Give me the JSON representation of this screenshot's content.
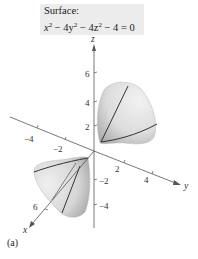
{
  "figure": {
    "label_title": "Surface:",
    "equation": {
      "t1": "x",
      "e1": "2",
      "t2": " − 4y",
      "e2": "2",
      "t3": " − 4z",
      "e3": "2",
      "t4": " − 4 = 0"
    },
    "tag": "(a)",
    "axes": {
      "x_label": "x",
      "y_label": "y",
      "z_label": "z",
      "z_ticks": [
        "6",
        "4",
        "2",
        "−2",
        "−4"
      ],
      "y_ticks": [
        "−4",
        "−2",
        "2",
        "4"
      ],
      "x_ticks": [
        "6"
      ]
    },
    "surface_type": "hyperboloid of two sheets",
    "colors": {
      "surface_light": "#e6e6e6",
      "surface_dark": "#a8a8a8",
      "axis": "#555555",
      "trace_line": "#333333",
      "label_bg": "#ececec"
    }
  }
}
